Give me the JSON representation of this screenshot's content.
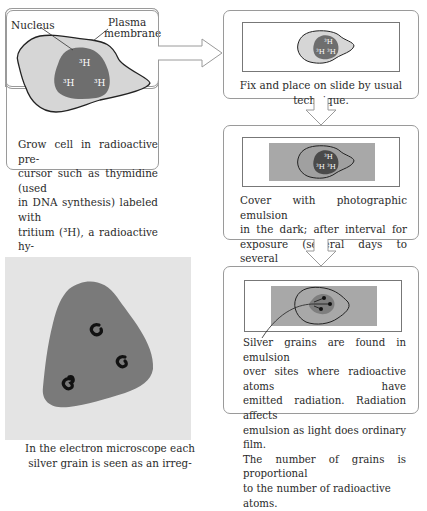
{
  "step1": {
    "label_nucleus": "Nucleus",
    "label_plasma_1": "Plasma",
    "label_plasma_2": "membrane",
    "isotope_labels": [
      "³H",
      "³H",
      "³H"
    ],
    "text_lines": [
      "Grow cell in radioactive pre-",
      "cursor such as thymidine (used",
      "in DNA synthesis) labeled with",
      "tritium (³H), a radioactive hy-",
      "drogen isotope."
    ]
  },
  "step2": {
    "text": "Fix and place on slide by usual technique.",
    "isotope_labels": [
      "³H",
      "³H",
      "³H"
    ]
  },
  "step3": {
    "text_lines": [
      "Cover with photographic emulsion",
      "in the dark; after interval for",
      "exposure (several days to several",
      "months) develop as with photographs."
    ],
    "isotope_labels": [
      "³H",
      "³H",
      "³H"
    ]
  },
  "step4": {
    "text_lines": [
      "Silver grains are found in emulsion",
      "over sites where radioactive atoms have",
      "emitted radiation. Radiation affects",
      "emulsion as light does ordinary film.",
      "The number of grains is proportional",
      "to the number of radioactive atoms."
    ]
  },
  "em_view": {
    "caption_lines": [
      "In the electron microscope each",
      "silver grain is seen as an irreg-"
    ]
  },
  "colors": {
    "cytoplasm": "#d6d6d6",
    "nucleus": "#6e6e6e",
    "emulsion": "#a8a8a8",
    "em_background": "#e4e4e4",
    "em_cell": "#7a7a7a",
    "border": "#9a9a9a"
  }
}
